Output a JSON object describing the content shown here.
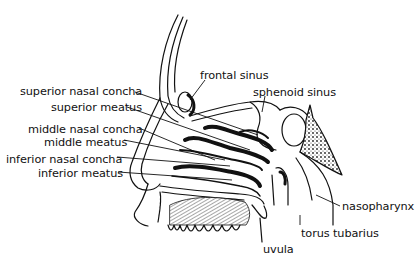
{
  "diagram": {
    "colors": {
      "ink": "#111111",
      "background": "#ffffff"
    },
    "labels": {
      "superior_nasal_concha": "superior nasal concha",
      "superior_meatus": "superior meatus",
      "middle_nasal_concha": "middle nasal concha",
      "middle_meatus": "middle meatus",
      "inferior_nasal_concha": "inferior nasal concha",
      "inferior_meatus": "inferior meatus",
      "frontal_sinus": "frontal sinus",
      "sphenoid_sinus": "sphenoid sinus",
      "nasopharynx": "nasopharynx",
      "torus_tubarius": "torus tubarius",
      "uvula": "uvula"
    }
  }
}
